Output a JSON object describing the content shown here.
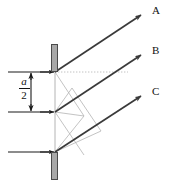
{
  "figure": {
    "type": "optics-diffraction-ray-diagram",
    "width": 172,
    "height": 185,
    "background_color": "#ffffff",
    "line_color": "#3a3a3a",
    "construction_line_color": "#b0b0b0",
    "dotted_line_color": "#c0c0c0",
    "barrier_fill_color": "#a8a8a8",
    "barrier_stroke_color": "#4a4a4a",
    "label_color": "#111111"
  },
  "rays": [
    {
      "id": "ray-a",
      "label": "A",
      "label_x": 152,
      "label_y": 9,
      "x1": 55,
      "y1": 72,
      "x2": 143,
      "y2": 14
    },
    {
      "id": "ray-b",
      "label": "B",
      "label_x": 152,
      "label_y": 50,
      "x1": 55,
      "y1": 112,
      "x2": 143,
      "y2": 54
    },
    {
      "id": "ray-c",
      "label": "C",
      "label_x": 152,
      "label_y": 91,
      "x1": 55,
      "y1": 152,
      "x2": 143,
      "y2": 95
    }
  ],
  "barriers": [
    {
      "id": "top-barrier",
      "x": 51,
      "y": 44,
      "width": 7,
      "height": 28
    },
    {
      "id": "bottom-barrier",
      "x": 51,
      "y": 152,
      "width": 7,
      "height": 28
    }
  ],
  "slits": [
    {
      "id": "slit-top",
      "x": 55,
      "y": 72
    },
    {
      "id": "slit-middle",
      "x": 55,
      "y": 112
    },
    {
      "id": "slit-bottom",
      "x": 55,
      "y": 152
    }
  ],
  "dotted_reference_line": {
    "id": "optical-axis",
    "x1": 55,
    "y1": 72,
    "x2": 128,
    "y2": 72
  },
  "aperture_line": {
    "id": "aperture-vertical-line",
    "x1": 55,
    "y1": 72,
    "x2": 55,
    "y2": 152
  },
  "extension_lines": [
    {
      "id": "extension-top",
      "x1": 8,
      "y1": 72,
      "x2": 55,
      "y2": 72
    },
    {
      "id": "extension-middle",
      "x1": 8,
      "y1": 112,
      "x2": 55,
      "y2": 112
    },
    {
      "id": "extension-bottom",
      "x1": 8,
      "y1": 152,
      "x2": 55,
      "y2": 152
    }
  ],
  "dimension": {
    "id": "half-aperture-dimension",
    "numerator": "a",
    "denominator": "2",
    "arrow_x": 31,
    "arrow_y_top": 72,
    "arrow_y_bottom": 112
  },
  "construction_lines": [
    {
      "id": "path-difference-top",
      "x1": 55,
      "y1": 72,
      "x2": 84,
      "y2": 116
    },
    {
      "id": "path-difference-mid",
      "x1": 55,
      "y1": 112,
      "x2": 84,
      "y2": 116
    },
    {
      "id": "wavefront-upper",
      "x1": 55,
      "y1": 112,
      "x2": 72,
      "y2": 88
    },
    {
      "id": "wavefront-lower",
      "x1": 55,
      "y1": 152,
      "x2": 84,
      "y2": 116
    },
    {
      "id": "parallelogram-side-a",
      "x1": 55,
      "y1": 112,
      "x2": 84,
      "y2": 155
    },
    {
      "id": "parallelogram-side-b",
      "x1": 72,
      "y1": 88,
      "x2": 101,
      "y2": 131
    },
    {
      "id": "parallelogram-base",
      "x1": 55,
      "y1": 152,
      "x2": 101,
      "y2": 131
    }
  ]
}
